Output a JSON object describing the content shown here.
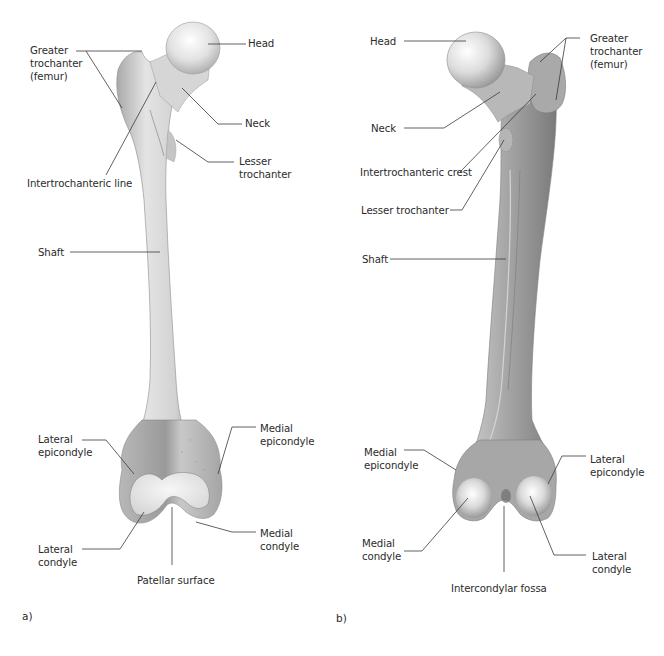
{
  "figure": {
    "panels": [
      {
        "id": "a",
        "tag": "a)",
        "view": "anterior",
        "labels": {
          "head": "Head",
          "greater_trochanter": "Greater\ntrochanter\n(femur)",
          "neck": "Neck",
          "lesser_trochanter": "Lesser\ntrochanter",
          "intertrochanteric_line": "Intertrochanteric line",
          "shaft": "Shaft",
          "lateral_epicondyle": "Lateral\nepicondyle",
          "medial_epicondyle": "Medial\nepicondyle",
          "lateral_condyle": "Lateral\ncondyle",
          "medial_condyle": "Medial\ncondyle",
          "patellar_surface": "Patellar surface"
        }
      },
      {
        "id": "b",
        "tag": "b)",
        "view": "posterior",
        "labels": {
          "head": "Head",
          "greater_trochanter": "Greater\ntrochanter\n(femur)",
          "neck": "Neck",
          "intertrochanteric_crest": "Intertrochanteric crest",
          "lesser_trochanter": "Lesser trochanter",
          "shaft": "Shaft",
          "medial_epicondyle": "Medial\nepicondyle",
          "lateral_epicondyle": "Lateral\nepicondyle",
          "medial_condyle": "Medial\ncondyle",
          "lateral_condyle": "Lateral\ncondyle",
          "intercondylar_fossa": "Intercondylar fossa"
        }
      }
    ]
  },
  "colors": {
    "background": "#ffffff",
    "bone_light": "#f4f4f4",
    "bone_mid": "#cfcfcf",
    "bone_dark": "#9a9a9a",
    "bone_posterior_mid": "#b5b5b5",
    "leader_line": "#3a3a3a",
    "text": "#2b2b2b"
  }
}
